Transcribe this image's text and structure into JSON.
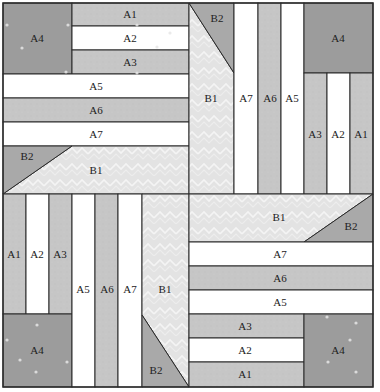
{
  "colors": {
    "A4": "#9c9c9c",
    "A_gray": "#c6c6c6",
    "A_white": "#ffffff",
    "B1": "#e3e3e3",
    "B1_pattern": "#f2f2f2",
    "B2": "#a9a9a9",
    "outline": "#2a2a2a"
  },
  "pieces": [
    {
      "q": "tl",
      "id": "A4",
      "type": "rect",
      "x": 3,
      "y": 3,
      "w": 69,
      "h": 71,
      "fill": "A4",
      "label": "A4",
      "lx": 37,
      "ly": 38
    },
    {
      "q": "tl",
      "id": "A1",
      "type": "rect",
      "x": 72,
      "y": 3,
      "w": 117,
      "h": 23,
      "fill": "A_gray",
      "label": "A1",
      "lx": 130,
      "ly": 14
    },
    {
      "q": "tl",
      "id": "A2",
      "type": "rect",
      "x": 72,
      "y": 26,
      "w": 117,
      "h": 24,
      "fill": "A_white",
      "label": "A2",
      "lx": 130,
      "ly": 38
    },
    {
      "q": "tl",
      "id": "A3",
      "type": "rect",
      "x": 72,
      "y": 50,
      "w": 117,
      "h": 24,
      "fill": "A_gray",
      "label": "A3",
      "lx": 130,
      "ly": 62
    },
    {
      "q": "tl",
      "id": "A5",
      "type": "rect",
      "x": 3,
      "y": 74,
      "w": 186,
      "h": 24,
      "fill": "A_white",
      "label": "A5",
      "lx": 96,
      "ly": 86
    },
    {
      "q": "tl",
      "id": "A6",
      "type": "rect",
      "x": 3,
      "y": 98,
      "w": 186,
      "h": 24,
      "fill": "A_gray",
      "label": "A6",
      "lx": 96,
      "ly": 110
    },
    {
      "q": "tl",
      "id": "A7",
      "type": "rect",
      "x": 3,
      "y": 122,
      "w": 186,
      "h": 24,
      "fill": "A_white",
      "label": "A7",
      "lx": 96,
      "ly": 134
    },
    {
      "q": "tl",
      "id": "B1",
      "type": "poly",
      "points": "72,146 189,146 189,194 3,194",
      "fill": "B1",
      "label": "B1",
      "lx": 96,
      "ly": 170
    },
    {
      "q": "tl",
      "id": "B2",
      "type": "poly",
      "points": "3,146 72,146 3,194",
      "fill": "B2",
      "label": "B2",
      "lx": 27,
      "ly": 156
    },
    {
      "q": "tr",
      "id": "B1",
      "type": "poly",
      "points": "189,3 234,73 234,194 189,194",
      "fill": "B1",
      "label": "B1",
      "lx": 211,
      "ly": 98
    },
    {
      "q": "tr",
      "id": "B2",
      "type": "poly",
      "points": "189,3 234,3 234,73",
      "fill": "B2",
      "label": "B2",
      "lx": 217,
      "ly": 18
    },
    {
      "q": "tr",
      "id": "A7",
      "type": "rect",
      "x": 234,
      "y": 3,
      "w": 24,
      "h": 191,
      "fill": "A_white",
      "label": "A7",
      "lx": 246,
      "ly": 98
    },
    {
      "q": "tr",
      "id": "A6",
      "type": "rect",
      "x": 258,
      "y": 3,
      "w": 23,
      "h": 191,
      "fill": "A_gray",
      "label": "A6",
      "lx": 270,
      "ly": 98
    },
    {
      "q": "tr",
      "id": "A5",
      "type": "rect",
      "x": 281,
      "y": 3,
      "w": 23,
      "h": 191,
      "fill": "A_white",
      "label": "A5",
      "lx": 292,
      "ly": 98
    },
    {
      "q": "tr",
      "id": "A4",
      "type": "rect",
      "x": 304,
      "y": 3,
      "w": 69,
      "h": 70,
      "fill": "A4",
      "label": "A4",
      "lx": 338,
      "ly": 38
    },
    {
      "q": "tr",
      "id": "A3",
      "type": "rect",
      "x": 304,
      "y": 73,
      "w": 23,
      "h": 121,
      "fill": "A_gray",
      "label": "A3",
      "lx": 315,
      "ly": 134
    },
    {
      "q": "tr",
      "id": "A2",
      "type": "rect",
      "x": 327,
      "y": 73,
      "w": 23,
      "h": 121,
      "fill": "A_white",
      "label": "A2",
      "lx": 338,
      "ly": 134
    },
    {
      "q": "tr",
      "id": "A1",
      "type": "rect",
      "x": 350,
      "y": 73,
      "w": 23,
      "h": 121,
      "fill": "A_gray",
      "label": "A1",
      "lx": 361,
      "ly": 134
    },
    {
      "q": "bl",
      "id": "A1",
      "type": "rect",
      "x": 3,
      "y": 194,
      "w": 23,
      "h": 120,
      "fill": "A_gray",
      "label": "A1",
      "lx": 14,
      "ly": 254
    },
    {
      "q": "bl",
      "id": "A2",
      "type": "rect",
      "x": 26,
      "y": 194,
      "w": 23,
      "h": 120,
      "fill": "A_white",
      "label": "A2",
      "lx": 37,
      "ly": 254
    },
    {
      "q": "bl",
      "id": "A3",
      "type": "rect",
      "x": 49,
      "y": 194,
      "w": 23,
      "h": 120,
      "fill": "A_gray",
      "label": "A3",
      "lx": 60,
      "ly": 254
    },
    {
      "q": "bl",
      "id": "A4",
      "type": "rect",
      "x": 3,
      "y": 314,
      "w": 69,
      "h": 73,
      "fill": "A4",
      "label": "A4",
      "lx": 37,
      "ly": 350
    },
    {
      "q": "bl",
      "id": "A5",
      "type": "rect",
      "x": 72,
      "y": 194,
      "w": 23,
      "h": 193,
      "fill": "A_white",
      "label": "A5",
      "lx": 83,
      "ly": 289
    },
    {
      "q": "bl",
      "id": "A6",
      "type": "rect",
      "x": 95,
      "y": 194,
      "w": 23,
      "h": 193,
      "fill": "A_gray",
      "label": "A6",
      "lx": 107,
      "ly": 289
    },
    {
      "q": "bl",
      "id": "A7",
      "type": "rect",
      "x": 118,
      "y": 194,
      "w": 24,
      "h": 193,
      "fill": "A_white",
      "label": "A7",
      "lx": 130,
      "ly": 289
    },
    {
      "q": "bl",
      "id": "B1",
      "type": "poly",
      "points": "142,194 189,194 189,387 142,315",
      "fill": "B1",
      "label": "B1",
      "lx": 165,
      "ly": 289
    },
    {
      "q": "bl",
      "id": "B2",
      "type": "poly",
      "points": "142,315 189,387 142,387",
      "fill": "B2",
      "label": "B2",
      "lx": 156,
      "ly": 370
    },
    {
      "q": "br",
      "id": "B1",
      "type": "poly",
      "points": "189,194 373,194 304,242 189,242",
      "fill": "B1",
      "label": "B1",
      "lx": 279,
      "ly": 217
    },
    {
      "q": "br",
      "id": "B2",
      "type": "poly",
      "points": "373,194 373,242 304,242",
      "fill": "B2",
      "label": "B2",
      "lx": 351,
      "ly": 226
    },
    {
      "q": "br",
      "id": "A7",
      "type": "rect",
      "x": 189,
      "y": 242,
      "w": 184,
      "h": 24,
      "fill": "A_white",
      "label": "A7",
      "lx": 280,
      "ly": 254
    },
    {
      "q": "br",
      "id": "A6",
      "type": "rect",
      "x": 189,
      "y": 266,
      "w": 184,
      "h": 24,
      "fill": "A_gray",
      "label": "A6",
      "lx": 280,
      "ly": 278
    },
    {
      "q": "br",
      "id": "A5",
      "type": "rect",
      "x": 189,
      "y": 290,
      "w": 184,
      "h": 24,
      "fill": "A_white",
      "label": "A5",
      "lx": 280,
      "ly": 302
    },
    {
      "q": "br",
      "id": "A3",
      "type": "rect",
      "x": 189,
      "y": 314,
      "w": 115,
      "h": 24,
      "fill": "A_gray",
      "label": "A3",
      "lx": 245,
      "ly": 326
    },
    {
      "q": "br",
      "id": "A2",
      "type": "rect",
      "x": 189,
      "y": 338,
      "w": 115,
      "h": 24,
      "fill": "A_white",
      "label": "A2",
      "lx": 245,
      "ly": 350
    },
    {
      "q": "br",
      "id": "A1",
      "type": "rect",
      "x": 189,
      "y": 362,
      "w": 115,
      "h": 25,
      "fill": "A_gray",
      "label": "A1",
      "lx": 245,
      "ly": 374
    },
    {
      "q": "br",
      "id": "A4",
      "type": "rect",
      "x": 304,
      "y": 314,
      "w": 69,
      "h": 73,
      "fill": "A4",
      "label": "A4",
      "lx": 338,
      "ly": 350
    }
  ],
  "stars": [
    [
      7,
      25
    ],
    [
      68,
      25
    ],
    [
      22,
      48
    ],
    [
      66,
      72
    ],
    [
      137,
      25
    ],
    [
      170,
      33
    ],
    [
      157,
      47
    ],
    [
      137,
      73
    ],
    [
      7,
      340
    ],
    [
      37,
      325
    ],
    [
      36,
      372
    ],
    [
      67,
      362
    ],
    [
      20,
      360
    ],
    [
      327,
      317
    ],
    [
      356,
      323
    ],
    [
      350,
      340
    ],
    [
      328,
      362
    ],
    [
      356,
      372
    ]
  ]
}
